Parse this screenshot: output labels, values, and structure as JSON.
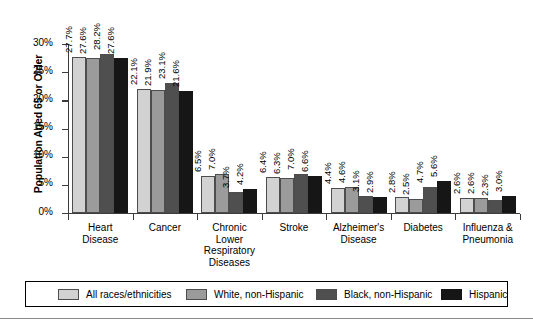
{
  "chart_data": {
    "type": "bar",
    "title": "",
    "subtitle": "",
    "xlabel": "",
    "ylabel": "Population Aged 65 or Older",
    "ylim": [
      0,
      30
    ],
    "ytick_labels": [
      "0%",
      "5%",
      "10%",
      "15%",
      "20%",
      "25%",
      "30%"
    ],
    "ytick_values": [
      0,
      5,
      10,
      15,
      20,
      25,
      30
    ],
    "grid": false,
    "legend_position": "bottom",
    "value_suffix": "%",
    "categories": [
      "Heart\nDisease",
      "Cancer",
      "Chronic\nLower\nRespiratory\nDiseases",
      "Stroke",
      "Alzheimer's\nDisease",
      "Diabetes",
      "Influenza &\nPneumonia"
    ],
    "series": [
      {
        "name": "All races/ethnicities",
        "color": "#d2d2d2",
        "values": [
          27.7,
          22.1,
          6.5,
          6.4,
          4.4,
          2.8,
          2.6
        ],
        "labels": [
          "27.7%",
          "22.1%",
          "6.5%",
          "6.4%",
          "4.4%",
          "2.8%",
          "2.6%"
        ]
      },
      {
        "name": "White, non-Hispanic",
        "color": "#9b9b9b",
        "values": [
          27.6,
          21.9,
          7.0,
          6.3,
          4.6,
          2.5,
          2.6
        ],
        "labels": [
          "27.6%",
          "21.9%",
          "7.0%",
          "6.3%",
          "4.6%",
          "2.5%",
          "2.6%"
        ]
      },
      {
        "name": "Black, non-Hispanic",
        "color": "#4f4f4f",
        "values": [
          28.2,
          23.1,
          3.7,
          7.0,
          3.1,
          4.7,
          2.3
        ],
        "labels": [
          "28.2%",
          "23.1%",
          "3.7%",
          "7.0%",
          "3.1%",
          "4.7%",
          "2.3%"
        ]
      },
      {
        "name": "Hispanic",
        "color": "#161616",
        "values": [
          27.6,
          21.6,
          4.2,
          6.6,
          2.9,
          5.6,
          3.0
        ],
        "labels": [
          "27.6%",
          "21.6%",
          "4.2%",
          "6.6%",
          "2.9%",
          "5.6%",
          "3.0%"
        ]
      }
    ]
  }
}
